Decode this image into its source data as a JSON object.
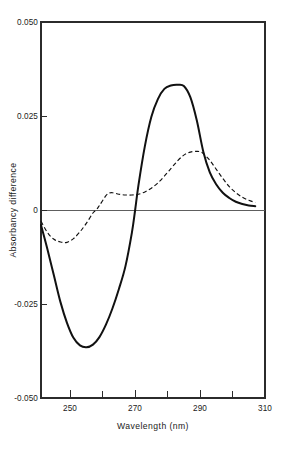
{
  "chart_data": {
    "type": "line",
    "title": "",
    "xlabel": "Wavelength (nm)",
    "ylabel": "Absorbancy difference",
    "xlim": [
      241,
      310
    ],
    "ylim": [
      -0.05,
      0.05
    ],
    "grid": false,
    "legend": "none",
    "x_major_ticks": [
      250,
      270,
      290,
      310
    ],
    "x_major_tick_labels": [
      "250",
      "270",
      "290",
      "310"
    ],
    "x_minor_ticks": [
      260,
      280,
      300
    ],
    "y_ticks": [
      0.05,
      0.025,
      0,
      -0.025,
      -0.05
    ],
    "y_tick_labels": [
      "0.050",
      "0.025",
      "0",
      "-0.025",
      "-0.050"
    ],
    "zero_reference_line": 0,
    "series": [
      {
        "name": "solid-curve",
        "style": "solid",
        "color": "#111111",
        "x": [
          241,
          243,
          245,
          247,
          249,
          251,
          253,
          255,
          257,
          259,
          261,
          263,
          265,
          267,
          269,
          270,
          271,
          273,
          275,
          277,
          279,
          281,
          283,
          285,
          287,
          289,
          291,
          293,
          295,
          297,
          299,
          301,
          303,
          305,
          307
        ],
        "y": [
          -0.004,
          -0.0105,
          -0.0175,
          -0.0245,
          -0.03,
          -0.034,
          -0.036,
          -0.0365,
          -0.0358,
          -0.0338,
          -0.0305,
          -0.0262,
          -0.021,
          -0.015,
          -0.006,
          0.0,
          0.0065,
          0.017,
          0.0248,
          0.0295,
          0.0322,
          0.0331,
          0.0333,
          0.033,
          0.03,
          0.0238,
          0.0155,
          0.01,
          0.0068,
          0.0046,
          0.0032,
          0.0022,
          0.0016,
          0.0012,
          0.001
        ]
      },
      {
        "name": "dashed-curve",
        "style": "dashed",
        "color": "#111111",
        "x": [
          241,
          243,
          245,
          247,
          249,
          251,
          253,
          255,
          257,
          258,
          259,
          261,
          262,
          263,
          265,
          267,
          269,
          271,
          273,
          275,
          277,
          279,
          281,
          283,
          285,
          287,
          289,
          290,
          291,
          293,
          295,
          297,
          299,
          301,
          303,
          305,
          307
        ],
        "y": [
          -0.003,
          -0.006,
          -0.0078,
          -0.0085,
          -0.0086,
          -0.0076,
          -0.0058,
          -0.0035,
          -0.0008,
          0.0,
          0.0012,
          0.0038,
          0.0045,
          0.0046,
          0.0042,
          0.004,
          0.004,
          0.0042,
          0.0048,
          0.0058,
          0.0072,
          0.009,
          0.011,
          0.013,
          0.0146,
          0.0154,
          0.0156,
          0.0155,
          0.015,
          0.0132,
          0.0108,
          0.0084,
          0.0062,
          0.0046,
          0.0034,
          0.0026,
          0.002
        ]
      }
    ],
    "annotations": []
  },
  "figure": {
    "background_color": "#ffffff",
    "axis_color": "#2b2b2b"
  }
}
